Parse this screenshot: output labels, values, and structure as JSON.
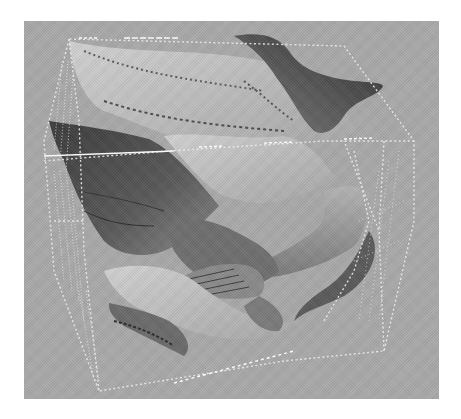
{
  "figure": {
    "background_color": "#a9a9a9",
    "page_color": "#ffffff",
    "surface_colors": {
      "light": "#c9c9c9",
      "mid": "#9a9a9a",
      "dark": "#4a4a4a",
      "darkest": "#2e2e2e"
    },
    "wireframe_color": "#f2f2f2",
    "text": []
  }
}
